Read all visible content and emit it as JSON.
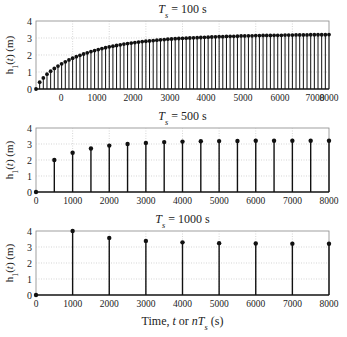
{
  "figure": {
    "xlabel": "Time, t or nT",
    "xlabel_sub": "s",
    "xlabel_unit": "(s)",
    "ylabel": "h",
    "ylabel_sub": "1",
    "ylabel_rest": "(t) (m)"
  },
  "chart_data": [
    {
      "type": "stem",
      "title": "T_s = 100 s",
      "title_var": "T",
      "title_sub": "s",
      "title_rest": " = 100 s",
      "ylabel": "h1(t) (m)",
      "ylim": [
        0,
        4
      ],
      "yticks": [
        0,
        1,
        2,
        3,
        4
      ],
      "xlim": [
        0,
        8000
      ],
      "xtick_labels": [
        "0",
        "1000",
        "2000",
        "3000",
        "4000",
        "5000",
        "6000",
        "7000",
        "8000"
      ],
      "xtick_label_px": [
        61,
        97,
        133,
        170,
        206,
        243,
        280,
        315,
        329
      ],
      "grid": true,
      "step": 100,
      "x_start": 0,
      "values": [
        0,
        0.4,
        0.65,
        0.87,
        1.05,
        1.21,
        1.35,
        1.48,
        1.6,
        1.71,
        1.81,
        1.9,
        1.98,
        2.06,
        2.13,
        2.2,
        2.26,
        2.32,
        2.38,
        2.43,
        2.48,
        2.52,
        2.56,
        2.6,
        2.64,
        2.67,
        2.7,
        2.73,
        2.76,
        2.79,
        2.81,
        2.83,
        2.85,
        2.87,
        2.89,
        2.91,
        2.93,
        2.94,
        2.96,
        2.97,
        2.98,
        2.99,
        3.0,
        3.01,
        3.02,
        3.03,
        3.04,
        3.05,
        3.06,
        3.07,
        3.08,
        3.08,
        3.09,
        3.1,
        3.1,
        3.11,
        3.12,
        3.12,
        3.13,
        3.13,
        3.14,
        3.14,
        3.15,
        3.15,
        3.15,
        3.16,
        3.16,
        3.16,
        3.17,
        3.17,
        3.17,
        3.18,
        3.18,
        3.18,
        3.18,
        3.19,
        3.19,
        3.19,
        3.19,
        3.19,
        3.2
      ]
    },
    {
      "type": "stem",
      "title": "T_s = 500 s",
      "title_var": "T",
      "title_sub": "s",
      "title_rest": " = 500 s",
      "ylabel": "h1(t) (m)",
      "ylim": [
        0,
        4
      ],
      "yticks": [
        0,
        1,
        2,
        3,
        4
      ],
      "xlim": [
        0,
        8000
      ],
      "xtick_labels": [
        "0",
        "1000",
        "2000",
        "3000",
        "4000",
        "5000",
        "6000",
        "7000",
        "8000"
      ],
      "grid": true,
      "step": 500,
      "x_start": 0,
      "values": [
        0,
        2.0,
        2.45,
        2.72,
        2.9,
        3.0,
        3.07,
        3.12,
        3.15,
        3.17,
        3.18,
        3.19,
        3.2,
        3.2,
        3.2,
        3.2,
        3.2
      ]
    },
    {
      "type": "stem",
      "title": "T_s = 1000 s",
      "title_var": "T",
      "title_sub": "s",
      "title_rest": " = 1000 s",
      "ylabel": "h1(t) (m)",
      "ylim": [
        0,
        4
      ],
      "yticks": [
        0,
        1,
        2,
        3,
        4
      ],
      "xlim": [
        0,
        8000
      ],
      "xtick_labels": [
        "0",
        "1000",
        "2000",
        "3000",
        "4000",
        "5000",
        "6000",
        "7000",
        "8000"
      ],
      "grid": true,
      "step": 1000,
      "x_start": 0,
      "values": [
        0,
        4.0,
        3.57,
        3.38,
        3.29,
        3.24,
        3.22,
        3.21,
        3.2
      ]
    }
  ]
}
